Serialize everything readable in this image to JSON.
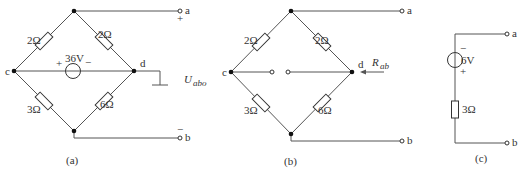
{
  "figures": [
    {
      "id": "a",
      "caption": "(a)",
      "nodes": {
        "c": "c",
        "d": "d",
        "a": "a",
        "b": "b"
      },
      "resistors": {
        "top_left": "2Ω",
        "top_right": "2Ω",
        "bottom_left": "3Ω",
        "bottom_right": "6Ω"
      },
      "source": {
        "value": "36V",
        "plus": "+",
        "minus": "−"
      },
      "terminal_a_sign": "+",
      "terminal_b_sign": "−",
      "voltage_label": "U",
      "voltage_sub": "abo"
    },
    {
      "id": "b",
      "caption": "(b)",
      "nodes": {
        "c": "c",
        "d": "d",
        "a": "a",
        "b": "b"
      },
      "resistors": {
        "top_left": "2Ω",
        "top_right": "2Ω",
        "bottom_left": "3Ω",
        "bottom_right": "6Ω"
      },
      "resistance_label": "R",
      "resistance_sub": "ab"
    },
    {
      "id": "c",
      "caption": "(c)",
      "nodes": {
        "a": "a",
        "b": "b"
      },
      "source": {
        "value": "6V",
        "plus": "+",
        "minus": "−"
      },
      "resistor": "3Ω"
    }
  ]
}
